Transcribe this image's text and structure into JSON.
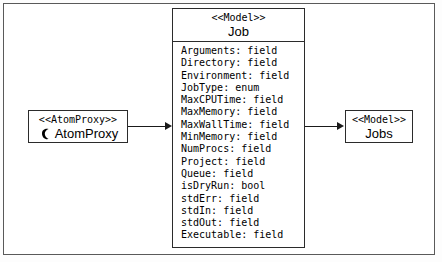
{
  "diagram": {
    "type": "uml-class-diagram",
    "background_color": "#ffffff",
    "frame_color": "#5a5a5a",
    "line_color": "#1a1a1a"
  },
  "classes": {
    "atomproxy": {
      "stereotype": "<<AtomProxy>>",
      "name": "AtomProxy",
      "icon": "atom-proxy-glyph-icon"
    },
    "job": {
      "stereotype": "<<Model>>",
      "name": "Job",
      "attributes": [
        "Arguments: field",
        "Directory: field",
        "Environment: field",
        "JobType: enum",
        "MaxCPUTime: field",
        "MaxMemory: field",
        "MaxWallTime: field",
        "MinMemory: field",
        "NumProcs: field",
        "Project: field",
        "Queue: field",
        "isDryRun: bool",
        "stdErr: field",
        "stdIn: field",
        "stdOut: field",
        "Executable: field"
      ]
    },
    "jobs": {
      "stereotype": "<<Model>>",
      "name": "Jobs"
    }
  },
  "connectors": [
    {
      "name": "atomproxy-to-job",
      "from": "AtomProxy",
      "to": "Job",
      "direction": "right",
      "arrowhead": "filled"
    },
    {
      "name": "job-to-jobs",
      "from": "Job",
      "to": "Jobs",
      "direction": "right",
      "arrowhead": "filled"
    }
  ]
}
